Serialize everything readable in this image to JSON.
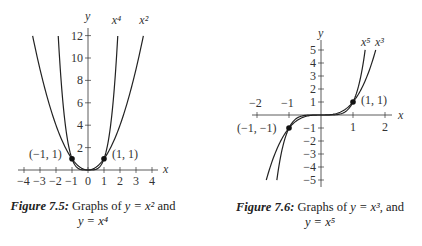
{
  "chart_data": [
    {
      "type": "line",
      "title": "Figure 7.5: Graphs of y = x^2 and y = x^4",
      "caption_label": "Figure 7.5",
      "caption_text_1": "Graphs of",
      "caption_eq_1": "y = x²",
      "caption_and": "and",
      "caption_eq_2": "y = x⁴",
      "xlabel": "x",
      "ylabel": "y",
      "xlim": [
        -4,
        4
      ],
      "ylim": [
        0,
        12
      ],
      "xticks": [
        "−4",
        "−3",
        "−2",
        "−1",
        "0",
        "1",
        "2",
        "3",
        "4"
      ],
      "yticks": [
        "2",
        "4",
        "6",
        "8",
        "10",
        "12"
      ],
      "series": [
        {
          "name": "x⁴",
          "x": [
            -1.86,
            -1.5,
            -1,
            -0.5,
            0,
            0.5,
            1,
            1.5,
            1.86
          ],
          "values": [
            12,
            5.06,
            1,
            0.06,
            0,
            0.06,
            1,
            5.06,
            12
          ]
        },
        {
          "name": "x²",
          "x": [
            -3.46,
            -3,
            -2,
            -1,
            0,
            1,
            2,
            3,
            3.46
          ],
          "values": [
            12,
            9,
            4,
            1,
            0,
            1,
            4,
            9,
            12
          ]
        }
      ],
      "points": [
        {
          "label": "(−1, 1)",
          "x": -1,
          "y": 1
        },
        {
          "label": "(1, 1)",
          "x": 1,
          "y": 1
        }
      ],
      "grid": false
    },
    {
      "type": "line",
      "title": "Figure 7.6: Graphs of y = x^3, and y = x^5",
      "caption_label": "Figure 7.6",
      "caption_text_1": "Graphs of",
      "caption_eq_1": "y = x³,",
      "caption_and": "and",
      "caption_eq_2": "y = x⁵",
      "xlabel": "x",
      "ylabel": "y",
      "xlim": [
        -2,
        2
      ],
      "ylim": [
        -5,
        5
      ],
      "xticks_top": [
        "−2",
        "−1"
      ],
      "xticks_bottom": [
        "1",
        "2"
      ],
      "yticks_pos": [
        "1",
        "2",
        "3",
        "4",
        "5"
      ],
      "yticks_neg": [
        "−1",
        "−2",
        "−3",
        "−4",
        "−5"
      ],
      "series": [
        {
          "name": "x⁵",
          "x": [
            -1.38,
            -1,
            -0.5,
            0,
            0.5,
            1,
            1.38
          ],
          "values": [
            -5,
            -1,
            -0.03,
            0,
            0.03,
            1,
            5
          ]
        },
        {
          "name": "x³",
          "x": [
            -1.71,
            -1,
            -0.5,
            0,
            0.5,
            1,
            1.71
          ],
          "values": [
            -5,
            -1,
            -0.125,
            0,
            0.125,
            1,
            5
          ]
        }
      ],
      "points": [
        {
          "label": "(−1, −1)",
          "x": -1,
          "y": -1
        },
        {
          "label": "(1, 1)",
          "x": 1,
          "y": 1
        }
      ],
      "grid": false
    }
  ]
}
